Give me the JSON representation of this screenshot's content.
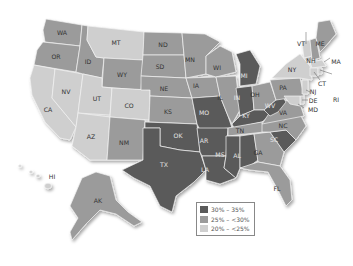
{
  "colors": {
    "dark": "#5a5a5a",
    "medium": "#9b9b9b",
    "light": "#cfcfcf"
  },
  "legend": {
    "items": [
      {
        "label": "30% – 35%",
        "category": "dark",
        "color": "#5a5a5a"
      },
      {
        "label": "25% – <30%",
        "category": "medium",
        "color": "#9b9b9b"
      },
      {
        "label": "20% – <25%",
        "category": "light",
        "color": "#cfcfcf"
      }
    ]
  },
  "states": {
    "WA": {
      "label": "WA",
      "category": "medium"
    },
    "OR": {
      "label": "OR",
      "category": "medium"
    },
    "CA": {
      "label": "CA",
      "category": "light"
    },
    "NV": {
      "label": "NV",
      "category": "light"
    },
    "ID": {
      "label": "ID",
      "category": "medium"
    },
    "MT": {
      "label": "MT",
      "category": "light"
    },
    "WY": {
      "label": "WY",
      "category": "medium"
    },
    "UT": {
      "label": "UT",
      "category": "light"
    },
    "CO": {
      "label": "CO",
      "category": "light"
    },
    "AZ": {
      "label": "AZ",
      "category": "light"
    },
    "NM": {
      "label": "NM",
      "category": "medium"
    },
    "ND": {
      "label": "ND",
      "category": "medium"
    },
    "SD": {
      "label": "SD",
      "category": "medium"
    },
    "NE": {
      "label": "NE",
      "category": "medium"
    },
    "KS": {
      "label": "KS",
      "category": "medium"
    },
    "OK": {
      "label": "OK",
      "category": "dark"
    },
    "TX": {
      "label": "TX",
      "category": "dark"
    },
    "MN": {
      "label": "MN",
      "category": "medium"
    },
    "IA": {
      "label": "IA",
      "category": "medium"
    },
    "MO": {
      "label": "MO",
      "category": "dark"
    },
    "AR": {
      "label": "AR",
      "category": "dark"
    },
    "LA": {
      "label": "LA",
      "category": "dark"
    },
    "WI": {
      "label": "WI",
      "category": "medium"
    },
    "IL": {
      "label": "IL",
      "category": "medium"
    },
    "MI": {
      "label": "MI",
      "category": "dark"
    },
    "IN": {
      "label": "IN",
      "category": "dark"
    },
    "OH": {
      "label": "OH",
      "category": "medium"
    },
    "KY": {
      "label": "KY",
      "category": "dark"
    },
    "TN": {
      "label": "TN",
      "category": "medium"
    },
    "MS": {
      "label": "MS",
      "category": "dark"
    },
    "AL": {
      "label": "AL",
      "category": "dark"
    },
    "GA": {
      "label": "GA",
      "category": "medium"
    },
    "FL": {
      "label": "FL",
      "category": "medium"
    },
    "SC": {
      "label": "SC",
      "category": "dark"
    },
    "NC": {
      "label": "NC",
      "category": "medium"
    },
    "VA": {
      "label": "VA",
      "category": "medium"
    },
    "WV": {
      "label": "WV",
      "category": "dark"
    },
    "PA": {
      "label": "PA",
      "category": "medium"
    },
    "NY": {
      "label": "NY",
      "category": "light"
    },
    "VT": {
      "label": "VT",
      "category": "light"
    },
    "NH": {
      "label": "NH",
      "category": "medium"
    },
    "ME": {
      "label": "ME",
      "category": "medium"
    },
    "MA": {
      "label": "MA",
      "category": "light"
    },
    "RI": {
      "label": "RI",
      "category": "light"
    },
    "CT": {
      "label": "CT",
      "category": "light"
    },
    "NJ": {
      "label": "NJ",
      "category": "light"
    },
    "DE": {
      "label": "DE",
      "category": "light"
    },
    "MD": {
      "label": "MD",
      "category": "light"
    },
    "AK": {
      "label": "AK",
      "category": "medium"
    },
    "HI": {
      "label": "HI",
      "category": "light"
    }
  }
}
